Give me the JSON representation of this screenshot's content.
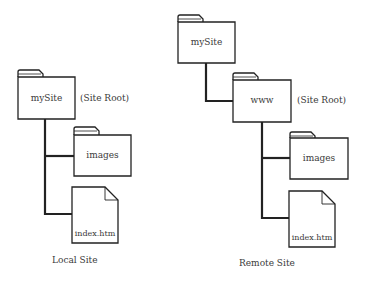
{
  "local_site": {
    "caption": "Local Site",
    "root_folder": {
      "label": "mySite",
      "note": "(Site Root)",
      "icon": "folder-icon"
    },
    "children": [
      {
        "label": "images",
        "icon": "folder-icon"
      },
      {
        "label": "index.htm",
        "icon": "file-icon"
      }
    ]
  },
  "remote_site": {
    "caption": "Remote Site",
    "top_folder": {
      "label": "mySite",
      "icon": "folder-icon"
    },
    "root_folder": {
      "label": "www",
      "note": "(Site Root)",
      "icon": "folder-icon"
    },
    "children": [
      {
        "label": "images",
        "icon": "folder-icon"
      },
      {
        "label": "index.htm",
        "icon": "file-icon"
      }
    ]
  }
}
